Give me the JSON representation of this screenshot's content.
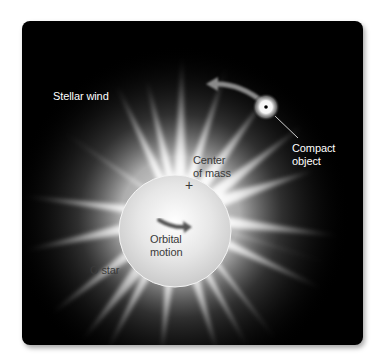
{
  "figure": {
    "background_color": "#000000",
    "page_color": "#ffffff",
    "labels": {
      "stellar_wind": "Stellar wind",
      "compact_object_line1": "Compact",
      "compact_object_line2": "object",
      "center_of_mass_line1": "Center",
      "center_of_mass_line2": "of mass",
      "center_marker": "+",
      "orbital_motion_line1": "Orbital",
      "orbital_motion_line2": "motion",
      "o_star": "O star"
    },
    "elements": {
      "o_star": {
        "type": "star-with-wind",
        "color": "#e8e8e8"
      },
      "compact_object": {
        "type": "glowing-point",
        "color": "#ffffff",
        "core_color": "#000000"
      },
      "orbit_arrow_compact": {
        "direction": "counterclockwise",
        "color": "#8a8a8a"
      },
      "orbit_arrow_star": {
        "direction": "right",
        "color": "#555555"
      }
    }
  }
}
